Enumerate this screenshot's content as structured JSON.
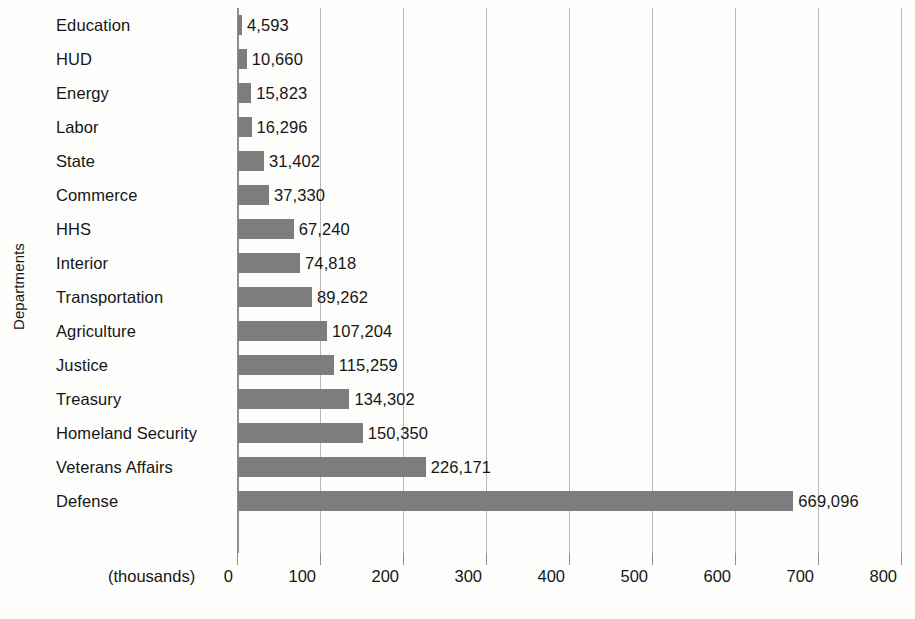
{
  "chart_data": {
    "type": "bar",
    "orientation": "horizontal",
    "title": "",
    "xlabel": "(thousands)",
    "ylabel": "Departments",
    "xlim": [
      0,
      800
    ],
    "xticks": [
      0,
      100,
      200,
      300,
      400,
      500,
      600,
      700,
      800
    ],
    "xtick_labels": [
      "0",
      "100",
      "200",
      "300",
      "400",
      "500",
      "600",
      "700",
      "800"
    ],
    "grid": true,
    "legend": null,
    "units": "thousands",
    "bar_color": "#7d7d7d",
    "gridline_color": "#b9b9b9",
    "axis_color": "#8d8d8d",
    "background_color": "#fdfdfc",
    "text_color": "#161616",
    "categories": [
      "Education",
      "HUD",
      "Energy",
      "Labor",
      "State",
      "Commerce",
      "HHS",
      "Interior",
      "Transportation",
      "Agriculture",
      "Justice",
      "Treasury",
      "Homeland Security",
      "Veterans Affairs",
      "Defense"
    ],
    "values": [
      4.593,
      10.66,
      15.823,
      16.296,
      31.402,
      37.33,
      67.24,
      74.818,
      89.262,
      107.204,
      115.259,
      134.302,
      150.35,
      226.171,
      669.096
    ],
    "value_labels": [
      "4,593",
      "10,660",
      "15,823",
      "16,296",
      "31,402",
      "37,330",
      "67,240",
      "74,818",
      "89,262",
      "107,204",
      "115,259",
      "134,302",
      "150,350",
      "226,171",
      "669,096"
    ]
  }
}
